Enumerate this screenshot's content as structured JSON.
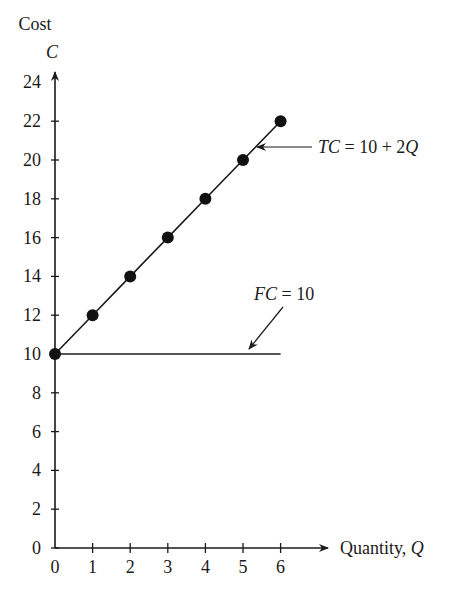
{
  "chart_data": {
    "type": "line",
    "title": "",
    "xlabel": "Quantity, Q",
    "ylabel_line1": "Cost",
    "ylabel_line2": "C",
    "x_ticks": [
      0,
      1,
      2,
      3,
      4,
      5,
      6
    ],
    "y_ticks": [
      0,
      2,
      4,
      6,
      8,
      10,
      12,
      14,
      16,
      18,
      20,
      22,
      24
    ],
    "xlim": [
      0,
      6
    ],
    "ylim": [
      0,
      24
    ],
    "grid": false,
    "series": [
      {
        "name": "TC = 10 + 2Q",
        "x": [
          0,
          1,
          2,
          3,
          4,
          5,
          6
        ],
        "y": [
          10,
          12,
          14,
          16,
          18,
          20,
          22
        ],
        "markers": true
      },
      {
        "name": "FC = 10",
        "x": [
          0,
          6
        ],
        "y": [
          10,
          10
        ],
        "markers": false
      }
    ],
    "annotations": [
      {
        "label_pre": "TC",
        "label_post": " = 10 + 2Q",
        "points_to": [
          4.5,
          19
        ]
      },
      {
        "label_pre": "FC",
        "label_post": " = 10",
        "points_to": [
          4.3,
          10
        ]
      }
    ]
  }
}
